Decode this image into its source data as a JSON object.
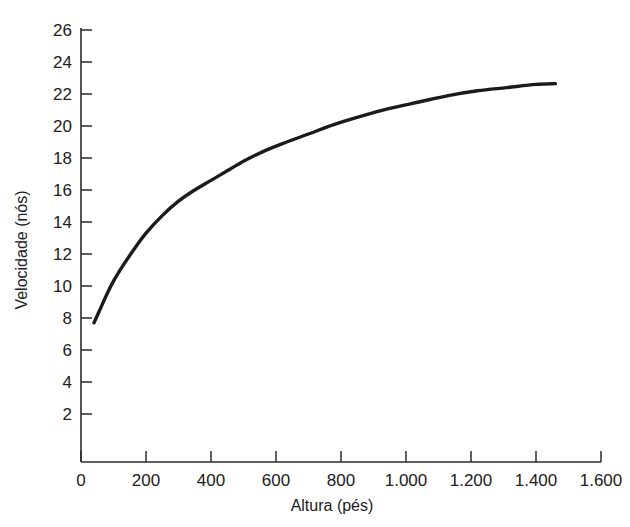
{
  "chart_data": {
    "type": "line",
    "title": "",
    "xlabel": "Altura (pés)",
    "ylabel": "Velocidade (nós)",
    "xlim": [
      0,
      1600
    ],
    "ylim": [
      0,
      26
    ],
    "grid": false,
    "legend": null,
    "x_ticks": [
      0,
      200,
      400,
      600,
      800,
      1000,
      1200,
      1400,
      1600
    ],
    "x_tick_labels": [
      "0",
      "200",
      "400",
      "600",
      "800",
      "1.000",
      "1.200",
      "1.400",
      "1.600"
    ],
    "y_ticks": [
      2,
      4,
      6,
      8,
      10,
      12,
      14,
      16,
      18,
      20,
      22,
      24,
      26
    ],
    "y_tick_labels": [
      "2",
      "4",
      "6",
      "8",
      "10",
      "12",
      "14",
      "16",
      "18",
      "20",
      "22",
      "24",
      "26"
    ],
    "series": [
      {
        "name": "Velocidade do vento",
        "color": "#1b1b1b",
        "x": [
          40,
          60,
          80,
          100,
          130,
          160,
          200,
          250,
          300,
          350,
          400,
          450,
          500,
          560,
          620,
          700,
          780,
          860,
          950,
          1040,
          1130,
          1220,
          1310,
          1400,
          1460
        ],
        "y": [
          7.7,
          8.6,
          9.5,
          10.3,
          11.3,
          12.2,
          13.3,
          14.4,
          15.3,
          16.0,
          16.6,
          17.2,
          17.8,
          18.4,
          18.9,
          19.5,
          20.1,
          20.6,
          21.1,
          21.5,
          21.9,
          22.2,
          22.4,
          22.6,
          22.65
        ]
      }
    ]
  },
  "axes": {
    "y_axis_name": "velocidade-nos",
    "x_axis_name": "altura-pes"
  }
}
